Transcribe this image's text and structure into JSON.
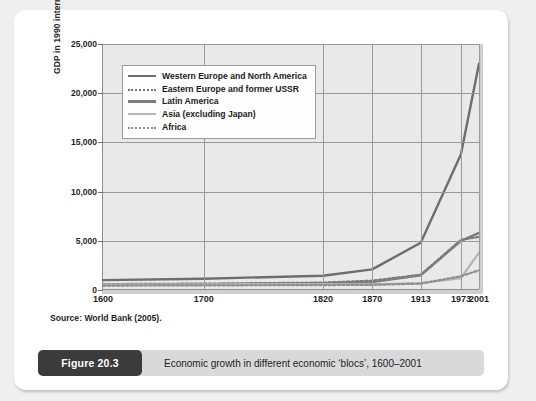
{
  "card": {
    "source_note": "Source: World Bank (2005).",
    "caption": {
      "badge": "Figure 20.3",
      "text": "Economic growth in different economic ‘blocs’, 1600–2001"
    }
  },
  "colors": {
    "page_background": "#efefef",
    "card_background": "#ffffff",
    "plot_background": "#e9e9e9",
    "grid": "#9a9a9a",
    "axis": "#8d8d8d",
    "series_dark": "#6e6e6e",
    "series_mid": "#8a8a8a",
    "series_light": "#b5b5b5",
    "badge": "#3b3b3b",
    "caption_bar": "#d9d9d9"
  },
  "chart_data": {
    "type": "line",
    "title": "",
    "xlabel": "",
    "ylabel": "GDP in 1990 international dollars",
    "categories": [
      "1600",
      "1700",
      "1820",
      "1870",
      "1913",
      "1973",
      "2001"
    ],
    "x_tick_labels": [
      "1600",
      "1700",
      "1820",
      "1870",
      "1913",
      "1973",
      "2001"
    ],
    "x_tick_positions": [
      0,
      0.268,
      0.585,
      0.716,
      0.845,
      0.952,
      1.0
    ],
    "ylim": [
      0,
      25000
    ],
    "y_tick_labels": [
      "0",
      "5,000",
      "10,000",
      "15,000",
      "20,000",
      "25,000"
    ],
    "y_tick_values": [
      0,
      5000,
      10000,
      15000,
      20000,
      25000
    ],
    "grid": true,
    "legend_position": "top-left-inside",
    "series": [
      {
        "name": "Western Europe and North America",
        "style": "solid",
        "color": "#6e6e6e",
        "width": 2.4,
        "values": [
          1000,
          1150,
          1450,
          2100,
          4800,
          13800,
          23000
        ]
      },
      {
        "name": "Eastern Europe and former USSR",
        "style": "dotted",
        "color": "#777777",
        "width": 2.2,
        "values": [
          600,
          650,
          750,
          950,
          1550,
          5100,
          5400
        ]
      },
      {
        "name": "Latin America",
        "style": "solid",
        "color": "#7d7d7d",
        "width": 2.4,
        "values": [
          500,
          550,
          700,
          800,
          1500,
          5000,
          5800
        ]
      },
      {
        "name": "Asia (excluding Japan)",
        "style": "solid",
        "color": "#b5b5b5",
        "width": 2.2,
        "values": [
          550,
          580,
          600,
          580,
          700,
          1200,
          3800
        ]
      },
      {
        "name": "Africa",
        "style": "dotted",
        "color": "#8e8e8e",
        "width": 2.2,
        "values": [
          450,
          470,
          500,
          520,
          650,
          1400,
          2000
        ]
      }
    ]
  }
}
